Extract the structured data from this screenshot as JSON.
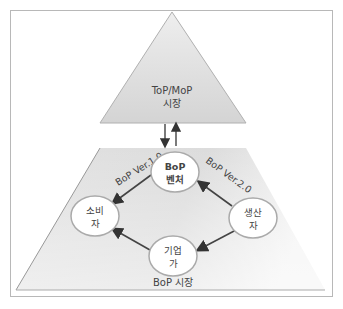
{
  "top_market": {
    "line1": "ToP/MoP",
    "line2": "시장"
  },
  "bottom_market": {
    "label": "BoP 시장"
  },
  "nodes": {
    "venture": {
      "line1": "BoP",
      "line2": "벤처"
    },
    "consumer": {
      "line1": "소비",
      "line2": "자"
    },
    "producer": {
      "line1": "생산",
      "line2": "자"
    },
    "entrepreneur": {
      "line1": "기업",
      "line2": "가"
    }
  },
  "edges": {
    "ver1": "BoP Ver.1.0",
    "ver2": "BoP Ver.2.0"
  },
  "colors": {
    "frame": "#b8b8b8",
    "shape_fill": "#d8d8d8",
    "arrow": "#333333",
    "node_fill": "#ffffff"
  }
}
